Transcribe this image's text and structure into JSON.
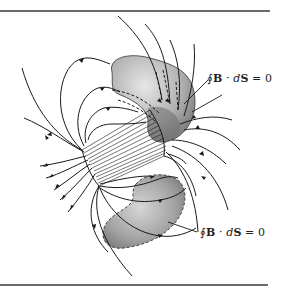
{
  "figure": {
    "labels": [
      {
        "id": "upper-surface-label",
        "prefix": "∮",
        "vector1": "B",
        "dot": " · ",
        "diff": "d",
        "vector2": "S",
        "suffix": " = 0"
      },
      {
        "id": "lower-surface-label",
        "prefix": "∮",
        "vector1": "B",
        "dot": " · ",
        "diff": "d",
        "vector2": "S",
        "suffix": " = 0"
      }
    ],
    "colors": {
      "rule": "#6a6a6a",
      "field_line": "#1a1a1a",
      "surface_light": "#d8d8d8",
      "surface_dark": "#8a8a8a",
      "background": "#ffffff"
    }
  }
}
